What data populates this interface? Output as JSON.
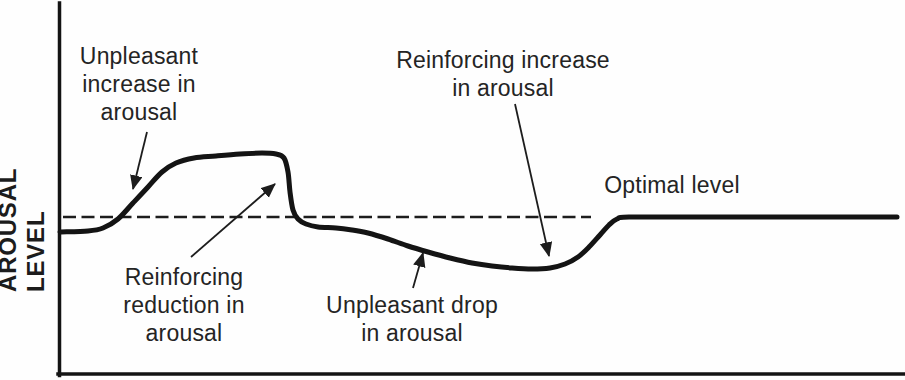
{
  "chart_data": {
    "type": "line",
    "title": "",
    "xlabel": "",
    "ylabel": "AROUSAL LEVEL",
    "legend": "none",
    "grid": "off",
    "coordinate_space": "pixels of 905x380 canvas, y increases downward; qualitative sketch with no numeric ticks",
    "axes": {
      "y_axis": {
        "x": 59.5,
        "y1": 3,
        "y2": 375
      },
      "x_axis": {
        "y": 374,
        "x1": 58,
        "x2": 905
      }
    },
    "optimal_line": {
      "y": 217,
      "x1": 63,
      "x2": 591,
      "style": "dashed"
    },
    "curve": {
      "name": "arousal-over-time",
      "points": [
        [
          60,
          232
        ],
        [
          88,
          231
        ],
        [
          103,
          228
        ],
        [
          118,
          219
        ],
        [
          133,
          203
        ],
        [
          148,
          187
        ],
        [
          162,
          172
        ],
        [
          176,
          163
        ],
        [
          194,
          158
        ],
        [
          216,
          156
        ],
        [
          240,
          154
        ],
        [
          262,
          153
        ],
        [
          276,
          154
        ],
        [
          284,
          158
        ],
        [
          288,
          172
        ],
        [
          290,
          192
        ],
        [
          293,
          210
        ],
        [
          298,
          219
        ],
        [
          306,
          224
        ],
        [
          318,
          227
        ],
        [
          336,
          228
        ],
        [
          352,
          230
        ],
        [
          368,
          233
        ],
        [
          388,
          239
        ],
        [
          408,
          246
        ],
        [
          428,
          252
        ],
        [
          450,
          258
        ],
        [
          472,
          263
        ],
        [
          492,
          266
        ],
        [
          512,
          268
        ],
        [
          532,
          269
        ],
        [
          550,
          268
        ],
        [
          565,
          264
        ],
        [
          578,
          257
        ],
        [
          590,
          246
        ],
        [
          600,
          235
        ],
        [
          609,
          225
        ],
        [
          617,
          219
        ],
        [
          629,
          217
        ],
        [
          700,
          217
        ],
        [
          800,
          217
        ],
        [
          897,
          217
        ]
      ]
    },
    "annotations": [
      {
        "id": "unpleasant-increase",
        "text": "Unpleasant\nincrease in\narousal",
        "cx": 139,
        "top": 42,
        "arrow": {
          "from": [
            147,
            132
          ],
          "to": [
            133,
            189
          ]
        }
      },
      {
        "id": "reinforcing-reduction",
        "text": "Reinforcing\nreduction in\narousal",
        "cx": 184,
        "top": 263,
        "arrow": {
          "from": [
            191,
            257
          ],
          "to": [
            275,
            184
          ]
        }
      },
      {
        "id": "reinforcing-increase",
        "text": "Reinforcing increase\nin arousal",
        "cx": 503,
        "top": 46,
        "arrow": {
          "from": [
            515,
            104
          ],
          "to": [
            549,
            256
          ]
        }
      },
      {
        "id": "unpleasant-drop",
        "text": "Unpleasant drop\nin arousal",
        "cx": 412,
        "top": 291,
        "arrow": {
          "from": [
            413,
            288
          ],
          "to": [
            423,
            253
          ]
        }
      },
      {
        "id": "optimal-level",
        "text": "Optimal level",
        "cx": 672,
        "top": 171,
        "arrow": null
      }
    ]
  }
}
